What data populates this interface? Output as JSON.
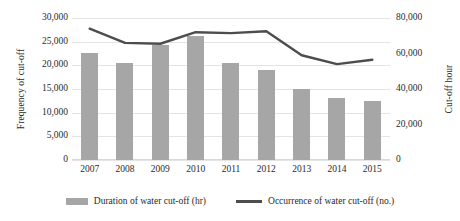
{
  "chart_data": {
    "type": "bar",
    "title": "",
    "subtitle": "",
    "xlabel": "",
    "ylabel": "Frequency of cut-off",
    "y2label": "Cut-off hour",
    "categories": [
      "2007",
      "2008",
      "2009",
      "2010",
      "2011",
      "2012",
      "2013",
      "2014",
      "2015"
    ],
    "grid": true,
    "legend_position": "bottom",
    "ylim": [
      0,
      30000
    ],
    "y2lim": [
      0,
      80000
    ],
    "yticks": [
      "30,000",
      "25,000",
      "20,000",
      "15,000",
      "10,000",
      "5,000",
      "0"
    ],
    "ytick_values": [
      30000,
      25000,
      20000,
      15000,
      10000,
      5000,
      0
    ],
    "y2ticks": [
      "80,000",
      "60,000",
      "40,000",
      "20,000",
      "0"
    ],
    "y2tick_values": [
      80000,
      60000,
      40000,
      20000,
      0
    ],
    "series": [
      {
        "name": "Duration of water cut-off (hr)",
        "kind": "bar",
        "axis": "left",
        "color": "#a6a6a6",
        "values": [
          22700,
          20500,
          24300,
          26300,
          20400,
          19000,
          15000,
          13000,
          12500
        ]
      },
      {
        "name": "Occurrence of water cut-off (no.)",
        "kind": "line",
        "axis": "right",
        "color": "#4d4d4d",
        "values": [
          74000,
          66000,
          65500,
          72000,
          71500,
          72500,
          59000,
          54000,
          56500
        ]
      }
    ]
  },
  "legend": {
    "items": [
      {
        "label": "Duration of water cut-off (hr)",
        "marker": "bar-swatch-icon"
      },
      {
        "label": "Occurrence of water cut-off (no.)",
        "marker": "line-swatch-icon"
      }
    ]
  },
  "colors": {
    "bar": "#a6a6a6",
    "line": "#4d4d4d",
    "grid": "#e4e4e4",
    "text": "#2a2a2a",
    "background": "#ffffff"
  }
}
